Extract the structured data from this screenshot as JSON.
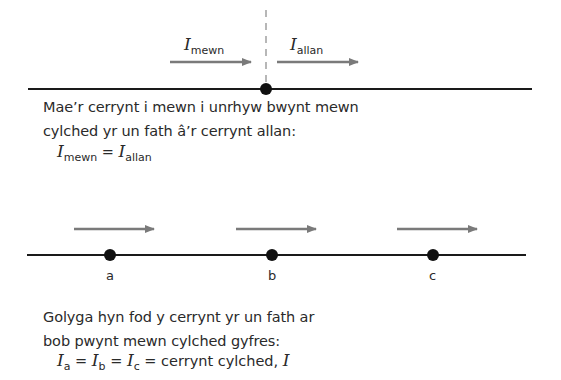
{
  "top_diagram": {
    "symbol": "I",
    "in_label_sub": "mewn",
    "out_label_sub": "allan"
  },
  "text1": {
    "line1": "Mae’r cerrynt i mewn i unrhyw bwynt mewn",
    "line2": "cylched yr un fath â’r cerrynt allan:"
  },
  "formula1": {
    "symbol": "I",
    "left_sub": "mewn",
    "equals": "=",
    "right_sub": "allan"
  },
  "bottom_diagram": {
    "points": [
      {
        "label": "a"
      },
      {
        "label": "b"
      },
      {
        "label": "c"
      }
    ]
  },
  "text2": {
    "line1": "Golyga hyn fod y cerrynt yr un fath ar",
    "line2": "bob pwynt mewn cylched gyfres:"
  },
  "formula2": {
    "symbol": "I",
    "sub_a": "a",
    "sub_b": "b",
    "sub_c": "c",
    "equals": "=",
    "tail": "= cerrynt cylched,",
    "tail_symbol": "I"
  },
  "colors": {
    "wire": "#1a1a1a",
    "arrow": "#7a7a7a",
    "dashed": "#888888",
    "text": "#2a2a2a"
  }
}
